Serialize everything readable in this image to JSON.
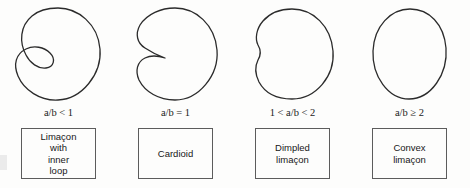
{
  "figure": {
    "background_color": "#fdfdfc",
    "curve_color": "#2b2b2b",
    "box_border_color": "#5c5c5c"
  },
  "panels": [
    {
      "curve_name": "limacon-with-inner-loop",
      "condition": "a/b < 1",
      "condition_lhs": "",
      "condition_var": "a/b",
      "condition_rel": "<",
      "condition_rhs": "1",
      "box_label": "Limaçon\nwith\ninner\nloop"
    },
    {
      "curve_name": "cardioid",
      "condition": "a/b = 1",
      "condition_lhs": "",
      "condition_var": "a/b",
      "condition_rel": "=",
      "condition_rhs": "1",
      "box_label": "Cardioid"
    },
    {
      "curve_name": "dimpled-limacon",
      "condition": "1 < a/b < 2",
      "condition_lhs": "1 <",
      "condition_var": "a/b",
      "condition_rel": "<",
      "condition_rhs": "2",
      "box_label": "Dimpled\nlimaçon"
    },
    {
      "curve_name": "convex-limacon",
      "condition": "a/b ≥ 2",
      "condition_lhs": "",
      "condition_var": "a/b",
      "condition_rel": "≥",
      "condition_rhs": "2",
      "box_label": "Convex\nlimaçon"
    }
  ]
}
